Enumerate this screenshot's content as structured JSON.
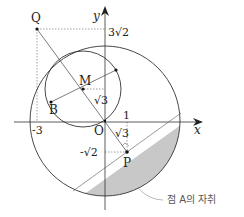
{
  "diagram": {
    "type": "coordinate-geometry",
    "axes": {
      "x_label": "x",
      "y_label": "y",
      "origin_label": "O"
    },
    "tick_labels": {
      "x_neg3": "-3",
      "x_1": "1",
      "y_3sqrt2": "3√2",
      "y_neg_sqrt2": "-√2",
      "sqrt3_upper": "√3",
      "sqrt3_lower": "√3"
    },
    "points": {
      "Q": "Q",
      "M": "M",
      "B": "B",
      "P": "P",
      "O": "O"
    },
    "annotation": "점 A의 자취",
    "colors": {
      "stroke": "#333333",
      "shade": "#c8c8c8",
      "dotted": "#888888",
      "annotation_text": "#555555"
    }
  }
}
